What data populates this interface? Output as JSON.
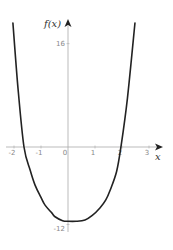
{
  "chart_data": {
    "type": "line",
    "title": "",
    "xlabel": "x",
    "ylabel": "f(x)",
    "xlim": [
      -2.5,
      3.5
    ],
    "ylim": [
      -13,
      20
    ],
    "grid": false,
    "legend": null,
    "x_ticks": [
      -2,
      -1,
      0,
      1,
      2,
      3
    ],
    "x_tick_labels": [
      "-2",
      "-1",
      "0",
      "1",
      "2",
      "3"
    ],
    "y_ticks": [
      16,
      -12
    ],
    "y_tick_labels": [
      "16",
      "-12"
    ],
    "series": [
      {
        "name": "f(x)",
        "color": "#222222",
        "x": [
          -2.04,
          -1.85,
          -1.63,
          -1.4,
          -1.22,
          -1.0,
          -0.85,
          -0.6,
          -0.48,
          -0.2,
          0.0,
          0.3,
          0.63,
          0.9,
          1.19,
          1.4,
          1.56,
          1.8,
          1.96,
          2.2,
          2.48
        ],
        "y": [
          19.2,
          9.0,
          0.0,
          -3.6,
          -5.9,
          -7.8,
          -9.0,
          -10.2,
          -10.8,
          -11.4,
          -11.5,
          -11.5,
          -11.3,
          -10.6,
          -9.4,
          -8.2,
          -6.7,
          -3.8,
          0.0,
          7.5,
          19.2
        ]
      }
    ]
  },
  "axes": {
    "x_label": "x",
    "y_label": "f(x)",
    "x_ticks": [
      "-2",
      "-1",
      "0",
      "1",
      "2",
      "3"
    ],
    "y_ticks": [
      "16",
      "-12"
    ]
  }
}
